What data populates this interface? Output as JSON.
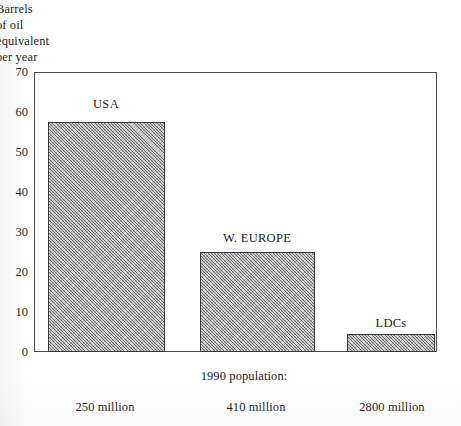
{
  "chart_data": {
    "type": "bar",
    "title": "",
    "xlabel": "",
    "ylabel": "Barrels of oil equivalent per year",
    "ylabel_lines": [
      "Barrels",
      "of oil",
      "equivalent",
      "per year"
    ],
    "categories": [
      "USA",
      "W. EUROPE",
      "LDCs"
    ],
    "values": [
      57.5,
      25,
      4.5
    ],
    "ylim": [
      0,
      70
    ],
    "yticks": [
      0,
      10,
      20,
      30,
      40,
      50,
      60,
      70
    ],
    "ytick_labels": [
      "0",
      "10",
      "20",
      "30",
      "40",
      "50",
      "60",
      "70"
    ],
    "grid": false,
    "legend": "none",
    "bar_fill": "#cfcfcf",
    "bar_pattern": "diagonal-hatch",
    "bar_border": "#3a3a3a",
    "annotations": {
      "population_heading": "1990 population:",
      "population_values": [
        "250 million",
        "410 million",
        "2800 million"
      ]
    }
  },
  "axis": {
    "y_caption_lines": [
      "Barrels",
      "of oil",
      "equivalent",
      "per year"
    ],
    "y_ticks": [
      "70",
      "60",
      "50",
      "40",
      "30",
      "20",
      "10",
      "0"
    ]
  },
  "bars": [
    {
      "label": "USA",
      "value": 57.5,
      "population": "250 million"
    },
    {
      "label": "W. EUROPE",
      "value": 25,
      "population": "410 million"
    },
    {
      "label": "LDCs",
      "value": 4.5,
      "population": "2800 million"
    }
  ],
  "footer": {
    "heading": "1990 population:"
  }
}
